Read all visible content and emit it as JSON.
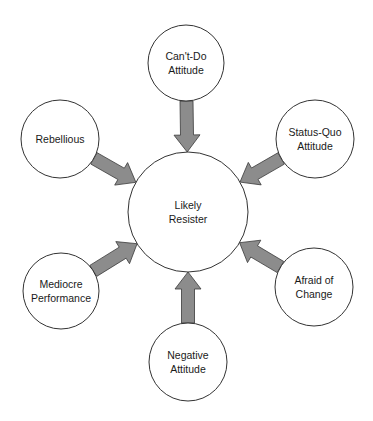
{
  "diagram": {
    "type": "hub-and-spoke",
    "center": {
      "id": "center",
      "lines": [
        "Likely",
        "Resister"
      ],
      "cx": 188,
      "cy": 212,
      "r": 60
    },
    "satellites": [
      {
        "id": "cant-do",
        "lines": [
          "Can't-Do",
          "Attitude"
        ],
        "cx": 186,
        "cy": 63,
        "r": 38
      },
      {
        "id": "status-quo",
        "lines": [
          "Status-Quo",
          "Attitude"
        ],
        "cx": 315,
        "cy": 139,
        "r": 39
      },
      {
        "id": "afraid",
        "lines": [
          "Afraid of",
          "Change"
        ],
        "cx": 314,
        "cy": 287,
        "r": 39
      },
      {
        "id": "negative",
        "lines": [
          "Negative",
          "Attitude"
        ],
        "cx": 188,
        "cy": 362,
        "r": 39
      },
      {
        "id": "mediocre",
        "lines": [
          "Mediocre",
          "Performance"
        ],
        "cx": 61,
        "cy": 291,
        "r": 38
      },
      {
        "id": "rebellious",
        "lines": [
          "Rebellious"
        ],
        "cx": 60,
        "cy": 139,
        "r": 39
      }
    ],
    "arrow_color": "#8c8c8c",
    "arrow_outline": "#3a3a3a",
    "circle_stroke": "#333333"
  }
}
